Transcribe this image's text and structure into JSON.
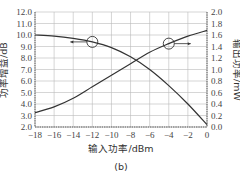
{
  "chart_data": {
    "type": "line",
    "title": "",
    "caption": "(b)",
    "xlabel": "输入功率/dBm",
    "ylabel_left": "功率增益/dB",
    "ylabel_right": "输出功率/mW",
    "xlim": [
      -18,
      0
    ],
    "ylim_left": [
      2.0,
      12.0
    ],
    "ylim_right": [
      0.0,
      2.0
    ],
    "grid": true,
    "x_ticks": [
      "-18",
      "-16",
      "-14",
      "-12",
      "-10",
      "-8",
      "-6",
      "-4",
      "-2",
      "0"
    ],
    "y_left_ticks": [
      "2.0",
      "3.0",
      "4.0",
      "5.0",
      "6.0",
      "7.0",
      "8.0",
      "9.0",
      "10.0",
      "11.0",
      "12.0"
    ],
    "y_right_ticks": [
      "0.0",
      "0.2",
      "0.4",
      "0.6",
      "0.8",
      "1.0",
      "1.2",
      "1.4",
      "1.6",
      "1.8",
      "2.0"
    ],
    "x": [
      -18,
      -16,
      -14,
      -12,
      -10,
      -8,
      -6,
      -4,
      -2,
      0
    ],
    "series": [
      {
        "name": "功率增益",
        "axis": "left",
        "unit": "dB",
        "values": [
          10.0,
          9.9,
          9.7,
          9.4,
          8.9,
          8.1,
          7.0,
          5.6,
          4.0,
          2.2
        ],
        "marker_annotation": {
          "x": -12,
          "y": 9.4,
          "arrow": "left"
        }
      },
      {
        "name": "输出功率",
        "axis": "right",
        "unit": "mW",
        "values": [
          0.25,
          0.35,
          0.5,
          0.7,
          0.9,
          1.1,
          1.3,
          1.45,
          1.58,
          1.68
        ],
        "marker_annotation": {
          "x": -4,
          "y": 1.45,
          "arrow": "right"
        }
      }
    ]
  },
  "labels": {
    "xlabel": "输入功率/dBm",
    "ylabel_left": "功率增益/dB",
    "ylabel_right": "输出功率/mW",
    "caption": "(b)"
  }
}
